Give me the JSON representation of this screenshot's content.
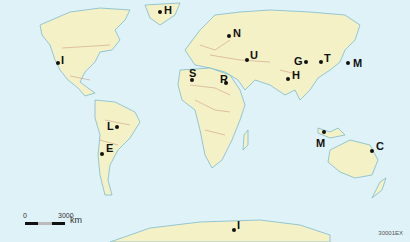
{
  "map": {
    "colors": {
      "ocean": "#dff2f8",
      "land": "#f4f1c6",
      "coast": "#6fb3cc",
      "border": "#c98a7a"
    },
    "markers": [
      {
        "label": "H",
        "x": 160,
        "y": 12,
        "lx": 164,
        "ly": 5
      },
      {
        "label": "I",
        "x": 58,
        "y": 63,
        "lx": 61,
        "ly": 55
      },
      {
        "label": "N",
        "x": 229,
        "y": 36,
        "lx": 233,
        "ly": 28
      },
      {
        "label": "S",
        "x": 192,
        "y": 80,
        "lx": 189,
        "ly": 68
      },
      {
        "label": "U",
        "x": 247,
        "y": 60,
        "lx": 250,
        "ly": 50
      },
      {
        "label": "R",
        "x": 226,
        "y": 83,
        "lx": 220,
        "ly": 74
      },
      {
        "label": "G",
        "x": 306,
        "y": 62,
        "lx": 294,
        "ly": 56
      },
      {
        "label": "T",
        "x": 321,
        "y": 62,
        "lx": 324,
        "ly": 53
      },
      {
        "label": "M",
        "x": 348,
        "y": 63,
        "lx": 353,
        "ly": 58
      },
      {
        "label": "H",
        "x": 288,
        "y": 79,
        "lx": 292,
        "ly": 70
      },
      {
        "label": "L",
        "x": 117,
        "y": 127,
        "lx": 107,
        "ly": 121
      },
      {
        "label": "E",
        "x": 102,
        "y": 154,
        "lx": 106,
        "ly": 143
      },
      {
        "label": "M",
        "x": 324,
        "y": 132,
        "lx": 316,
        "ly": 138
      },
      {
        "label": "C",
        "x": 372,
        "y": 151,
        "lx": 376,
        "ly": 141
      },
      {
        "label": "I",
        "x": 234,
        "y": 230,
        "lx": 237,
        "ly": 220
      }
    ]
  },
  "scale_bar": {
    "start": "0",
    "end": "3000",
    "unit": "km"
  },
  "map_code": "30001EX"
}
